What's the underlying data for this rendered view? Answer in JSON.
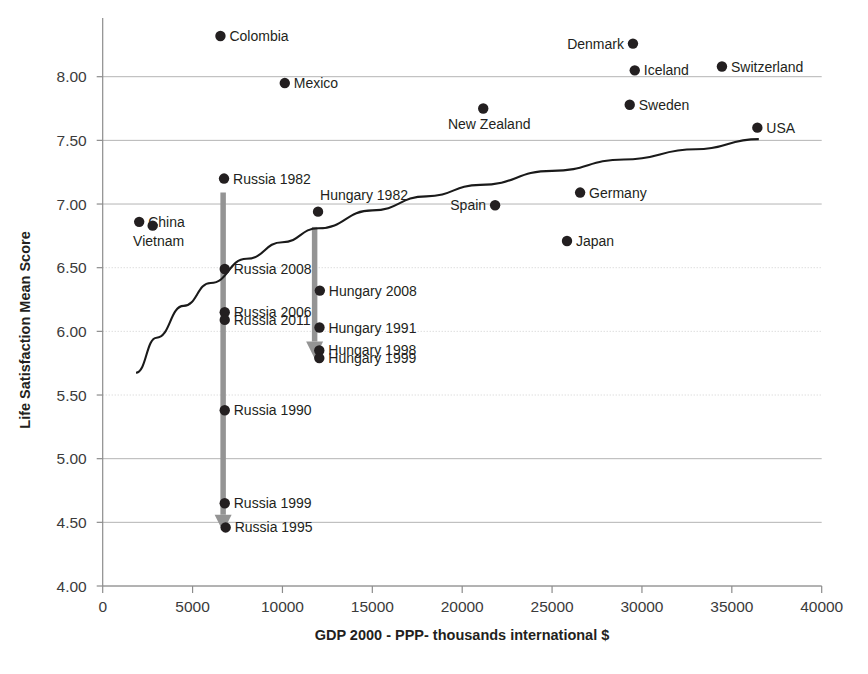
{
  "chart_data": {
    "type": "scatter",
    "title": "",
    "xlabel": "GDP 2000 - PPP- thousands international $",
    "ylabel": "Life Satisfaction Mean Score",
    "xlim": [
      0,
      40000
    ],
    "ylim": [
      4.0,
      8.4
    ],
    "grid": true,
    "legend": "none",
    "xticks": [
      "0",
      "5000",
      "10000",
      "15000",
      "20000",
      "25000",
      "30000",
      "35000",
      "40000"
    ],
    "yticks": [
      "4.00",
      "4.50",
      "5.00",
      "5.50",
      "6.00",
      "6.50",
      "7.00",
      "7.50",
      "8.00"
    ],
    "xtick_values": [
      0,
      5000,
      10000,
      15000,
      20000,
      25000,
      30000,
      35000,
      40000
    ],
    "ytick_values": [
      4.0,
      4.5,
      5.0,
      5.5,
      6.0,
      6.5,
      7.0,
      7.5,
      8.0
    ],
    "points": [
      {
        "label": "Colombia",
        "x": 6550,
        "y": 8.32,
        "label_pos": "right"
      },
      {
        "label": "Mexico",
        "x": 10130,
        "y": 7.95,
        "label_pos": "right"
      },
      {
        "label": "Denmark",
        "x": 29500,
        "y": 8.26,
        "label_pos": "left"
      },
      {
        "label": "Iceland",
        "x": 29600,
        "y": 8.05,
        "label_pos": "right"
      },
      {
        "label": "Switzerland",
        "x": 34450,
        "y": 8.08,
        "label_pos": "right"
      },
      {
        "label": "Sweden",
        "x": 29320,
        "y": 7.78,
        "label_pos": "right"
      },
      {
        "label": "New Zealand",
        "x": 21170,
        "y": 7.75,
        "label_pos": "below"
      },
      {
        "label": "USA",
        "x": 36420,
        "y": 7.6,
        "label_pos": "right"
      },
      {
        "label": "Germany",
        "x": 26560,
        "y": 7.09,
        "label_pos": "right"
      },
      {
        "label": "Spain",
        "x": 21830,
        "y": 6.99,
        "label_pos": "left"
      },
      {
        "label": "Japan",
        "x": 25830,
        "y": 6.71,
        "label_pos": "right"
      },
      {
        "label": "China",
        "x": 2030,
        "y": 6.86,
        "label_pos": "right"
      },
      {
        "label": "Vietnam",
        "x": 2780,
        "y": 6.83,
        "label_pos": "below"
      },
      {
        "label": "Russia 1982",
        "x": 6750,
        "y": 7.2,
        "label_pos": "right"
      },
      {
        "label": "Russia 2008",
        "x": 6790,
        "y": 6.49,
        "label_pos": "right"
      },
      {
        "label": "Russia 2006",
        "x": 6790,
        "y": 6.15,
        "label_pos": "right"
      },
      {
        "label": "Russia 2011",
        "x": 6790,
        "y": 6.09,
        "label_pos": "right"
      },
      {
        "label": "Russia 1990",
        "x": 6790,
        "y": 5.38,
        "label_pos": "right"
      },
      {
        "label": "Russia 1999",
        "x": 6790,
        "y": 4.65,
        "label_pos": "right"
      },
      {
        "label": "Russia 1995",
        "x": 6840,
        "y": 4.46,
        "label_pos": "right"
      },
      {
        "label": "Hungary 1982",
        "x": 11980,
        "y": 6.94,
        "label_pos": "above-right"
      },
      {
        "label": "Hungary 2008",
        "x": 12080,
        "y": 6.32,
        "label_pos": "right"
      },
      {
        "label": "Hungary 1991",
        "x": 12060,
        "y": 6.03,
        "label_pos": "right"
      },
      {
        "label": "Hungary 1998",
        "x": 12050,
        "y": 5.85,
        "label_pos": "right"
      },
      {
        "label": "Hungary 1999",
        "x": 12050,
        "y": 5.79,
        "label_pos": "right"
      }
    ],
    "trend_curve": {
      "note": "logarithmic fit line",
      "points": [
        {
          "x": 1850,
          "y": 5.675
        },
        {
          "x": 3000,
          "y": 5.95
        },
        {
          "x": 4500,
          "y": 6.2
        },
        {
          "x": 6000,
          "y": 6.38
        },
        {
          "x": 8000,
          "y": 6.57
        },
        {
          "x": 10000,
          "y": 6.7
        },
        {
          "x": 12000,
          "y": 6.81
        },
        {
          "x": 15000,
          "y": 6.95
        },
        {
          "x": 18000,
          "y": 7.06
        },
        {
          "x": 21000,
          "y": 7.15
        },
        {
          "x": 25000,
          "y": 7.26
        },
        {
          "x": 29000,
          "y": 7.35
        },
        {
          "x": 33000,
          "y": 7.43
        },
        {
          "x": 36500,
          "y": 7.51
        }
      ]
    },
    "annotations": [
      {
        "name": "russia-decline-arrow",
        "type": "down-arrow",
        "x": 6700,
        "y_from": 7.09,
        "y_to": 4.56,
        "color": "#949494"
      },
      {
        "name": "hungary-decline-arrow",
        "type": "down-arrow",
        "x": 11790,
        "y_from": 6.82,
        "y_to": 5.92,
        "color": "#949494"
      }
    ],
    "colors": {
      "marker": "#231f20",
      "trend_line": "#1a1a1a",
      "arrow": "#949494",
      "grid": "#b4b4b4",
      "axis": "#8c8c8c",
      "background": "#ffffff",
      "text": "#231f20"
    }
  }
}
